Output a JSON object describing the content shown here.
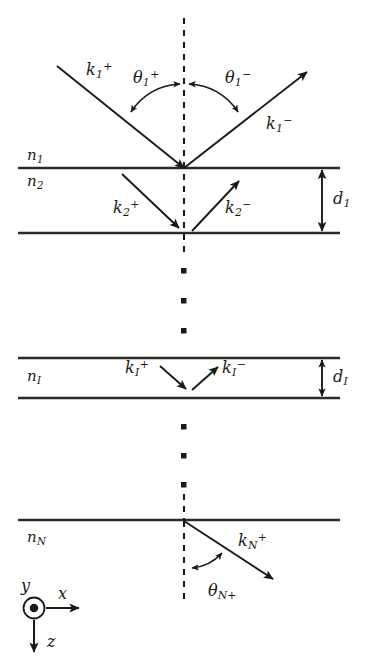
{
  "figure": {
    "type": "optics-layer-stack-diagram",
    "colors": {
      "ink": "#1a1a16",
      "background": "#ffffff",
      "line": "#2b2b26"
    }
  },
  "labels": {
    "k1_plus": {
      "base": "k",
      "sub": "1",
      "sup": "+"
    },
    "k1_minus": {
      "base": "k",
      "sub": "1",
      "sup": "−"
    },
    "k2_plus": {
      "base": "k",
      "sub": "2",
      "sup": "+"
    },
    "k2_minus": {
      "base": "k",
      "sub": "2",
      "sup": "−"
    },
    "kI_plus": {
      "base": "k",
      "sub": "I",
      "sup": "+"
    },
    "kI_minus": {
      "base": "k",
      "sub": "I",
      "sup": "−"
    },
    "kN_plus": {
      "base": "k",
      "sub": "N",
      "sup": "+"
    },
    "theta1_plus": {
      "base": "θ",
      "sub": "1",
      "sup": "+"
    },
    "theta1_minus": {
      "base": "θ",
      "sub": "1",
      "sup": "−"
    },
    "thetaN_plus": {
      "base": "θ",
      "sub": "N+",
      "sup": ""
    },
    "n1": {
      "base": "n",
      "sub": "1",
      "sup": ""
    },
    "n2": {
      "base": "n",
      "sub": "2",
      "sup": ""
    },
    "nI": {
      "base": "n",
      "sub": "I",
      "sup": ""
    },
    "nN": {
      "base": "n",
      "sub": "N",
      "sup": ""
    },
    "d1": {
      "base": "d",
      "sub": "1",
      "sup": ""
    },
    "dI": {
      "base": "d",
      "sub": "I",
      "sup": ""
    },
    "axis_x": {
      "base": "x",
      "sub": "",
      "sup": ""
    },
    "axis_y": {
      "base": "y",
      "sub": "",
      "sup": ""
    },
    "axis_z": {
      "base": "z",
      "sub": "",
      "sup": ""
    }
  },
  "icons": {
    "normal_line": "vertical-dashed-normal-icon",
    "ellipsis_upper": "vertical-ellipsis-icon",
    "ellipsis_lower": "vertical-ellipsis-icon",
    "axis_origin": "y-axis-out-of-page-icon"
  },
  "geometry": {
    "interfaces_y": [
      168,
      233,
      358,
      398,
      520
    ],
    "line_x_range": [
      18,
      340
    ],
    "normal_x": 184,
    "origin_top": [
      184,
      168
    ],
    "origin_bottom": [
      184,
      521
    ],
    "thickness_marker_x": 322
  }
}
